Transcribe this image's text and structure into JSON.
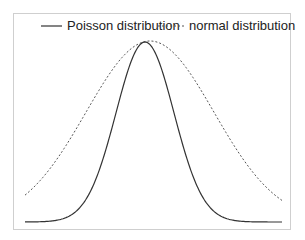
{
  "chart_data": {
    "type": "line",
    "title": "",
    "xlabel": "",
    "ylabel": "",
    "grid": false,
    "legend_position": "top",
    "legend": [
      "Poisson distribution",
      "normal distribution"
    ],
    "series": [
      {
        "name": "Poisson distribution",
        "style": "solid",
        "color": "#333333",
        "center_px": 145,
        "sigma_px": 29,
        "peak_px": 180
      },
      {
        "name": "normal distribution",
        "style": "dotted",
        "color": "#555555",
        "center_px": 150,
        "sigma_px": 64,
        "peak_px": 181
      }
    ],
    "frame": {
      "x0": 13,
      "y0": 13,
      "x1": 291,
      "y1": 230
    },
    "plot_range_px": {
      "x_start": 25,
      "x_end": 282,
      "baseline_y": 222
    }
  },
  "legend": {
    "poisson_label": "Poisson distribution",
    "normal_label": "normal distribution"
  }
}
